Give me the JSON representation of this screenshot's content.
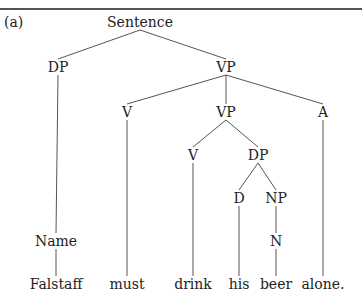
{
  "figure": {
    "label": "(a)",
    "type": "syntax-tree"
  },
  "tree": {
    "nodes": [
      {
        "id": "s",
        "label": "Sentence",
        "x": 140,
        "y": 22
      },
      {
        "id": "dp1",
        "label": "DP",
        "x": 58,
        "y": 67
      },
      {
        "id": "vp1",
        "label": "VP",
        "x": 226,
        "y": 67
      },
      {
        "id": "v1",
        "label": "V",
        "x": 127,
        "y": 112
      },
      {
        "id": "vp2",
        "label": "VP",
        "x": 226,
        "y": 112
      },
      {
        "id": "a",
        "label": "A",
        "x": 323,
        "y": 112
      },
      {
        "id": "v2",
        "label": "V",
        "x": 193,
        "y": 155
      },
      {
        "id": "dp2",
        "label": "DP",
        "x": 258,
        "y": 155
      },
      {
        "id": "d",
        "label": "D",
        "x": 239,
        "y": 198
      },
      {
        "id": "np",
        "label": "NP",
        "x": 276,
        "y": 198
      },
      {
        "id": "name",
        "label": "Name",
        "x": 56,
        "y": 241
      },
      {
        "id": "n",
        "label": "N",
        "x": 276,
        "y": 241
      },
      {
        "id": "w1",
        "label": "Falstaff",
        "x": 56,
        "y": 284
      },
      {
        "id": "w2",
        "label": "must",
        "x": 127,
        "y": 284
      },
      {
        "id": "w3",
        "label": "drink",
        "x": 193,
        "y": 284
      },
      {
        "id": "w4",
        "label": "his",
        "x": 239,
        "y": 284
      },
      {
        "id": "w5",
        "label": "beer",
        "x": 276,
        "y": 284
      },
      {
        "id": "w6",
        "label": "alone.",
        "x": 323,
        "y": 284
      }
    ],
    "edges": [
      [
        "s",
        "dp1"
      ],
      [
        "s",
        "vp1"
      ],
      [
        "dp1",
        "name"
      ],
      [
        "name",
        "w1"
      ],
      [
        "vp1",
        "v1"
      ],
      [
        "vp1",
        "vp2"
      ],
      [
        "vp1",
        "a"
      ],
      [
        "v1",
        "w2"
      ],
      [
        "vp2",
        "v2"
      ],
      [
        "vp2",
        "dp2"
      ],
      [
        "v2",
        "w3"
      ],
      [
        "dp2",
        "d"
      ],
      [
        "dp2",
        "np"
      ],
      [
        "d",
        "w4"
      ],
      [
        "np",
        "n"
      ],
      [
        "n",
        "w5"
      ],
      [
        "a",
        "w6"
      ]
    ],
    "sentence": "Falstaff must drink his beer alone."
  }
}
